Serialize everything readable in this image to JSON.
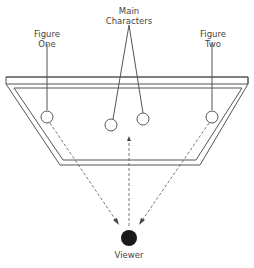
{
  "labels": {
    "figure_one": [
      "Figure",
      "One"
    ],
    "main_characters": [
      "Main",
      "Characters"
    ],
    "figure_two": [
      "Figure",
      "Two"
    ],
    "viewer": "Viewer"
  },
  "colors": {
    "line": "#555555",
    "viewer_fill": "#1a1a1a"
  }
}
